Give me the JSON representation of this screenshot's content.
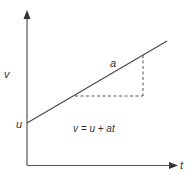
{
  "diagram": {
    "y_axis_label": "v",
    "x_axis_label": "t",
    "intercept_label": "u",
    "slope_label": "a",
    "equation": "v = u + at",
    "colors": {
      "line": "#4a4a4a",
      "axis": "#555555",
      "dashed": "#555555",
      "text": "#333333"
    }
  }
}
